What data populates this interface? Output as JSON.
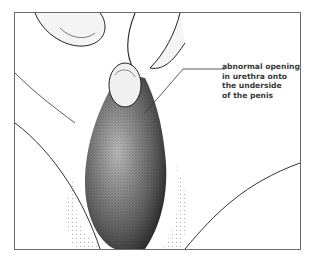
{
  "figure": {
    "type": "medical-illustration",
    "annotation": {
      "lines": [
        "abnormal opening",
        "in urethra onto",
        "the underside",
        "of the penis"
      ]
    }
  }
}
